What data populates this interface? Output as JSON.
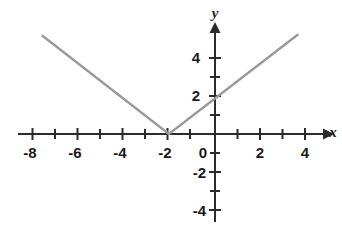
{
  "chart_data": {
    "type": "line",
    "title": "",
    "xlabel": "x",
    "ylabel": "y",
    "xlim": [
      -8.7,
      5.1
    ],
    "ylim": [
      -5.0,
      5.4
    ],
    "grid": false,
    "legend": null,
    "x_tick_labels": [
      "-8",
      "-6",
      "-4",
      "-2",
      "0",
      "2",
      "4"
    ],
    "x_tick_values": [
      -8,
      -6,
      -4,
      -2,
      0,
      2,
      4
    ],
    "x_minor_tick_values": [
      -7,
      -5,
      -3,
      -1,
      1,
      3
    ],
    "y_tick_labels": [
      "4",
      "2",
      "-2",
      "-4"
    ],
    "y_tick_values": [
      4,
      2,
      -2,
      -4
    ],
    "y_minor_tick_values": [
      3,
      1,
      -1,
      -3
    ],
    "origin_label": "0",
    "series": [
      {
        "name": "y = |x + 2|",
        "color": "#9a9a9a",
        "points": [
          [
            -7.7,
            5.2
          ],
          [
            -2.05,
            0.0
          ],
          [
            3.7,
            5.25
          ]
        ]
      }
    ],
    "vertex": [
      -2.05,
      0.0
    ],
    "y_intercept": 2.0,
    "axis_color": "#2b2b2b"
  },
  "figure": {
    "x_axis_name": "x-axis",
    "y_axis_name": "y-axis",
    "x_arrow_name": "x-axis-arrow",
    "y_arrow_name": "y-axis-arrow",
    "curve_name": "absolute-value-graph"
  }
}
